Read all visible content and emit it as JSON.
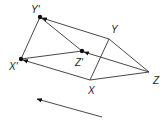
{
  "diagram": {
    "type": "geometric-translation",
    "colors": {
      "line": "#333333",
      "point": "#111111",
      "label": "#222222"
    },
    "points": {
      "X": {
        "label": "X",
        "x": 90,
        "y": 80
      },
      "Y": {
        "label": "Y",
        "x": 109,
        "y": 39
      },
      "Z": {
        "label": "Z",
        "x": 149,
        "y": 72
      },
      "X1": {
        "label": "X'",
        "x": 21,
        "y": 59
      },
      "Y1": {
        "label": "Y'",
        "x": 40,
        "y": 17
      },
      "Z1": {
        "label": "Z'",
        "x": 82,
        "y": 51
      }
    },
    "labels": {
      "X": "X",
      "Y": "Y",
      "Z": "Z",
      "X1": "X'",
      "Y1": "Y'",
      "Z1": "Z'"
    },
    "original_triangle": [
      "X",
      "Y",
      "Z"
    ],
    "image_triangle": [
      "X'",
      "Y'",
      "Z'"
    ],
    "translation_vectors": [
      "X→X'",
      "Y→Y'",
      "Z→Z'"
    ],
    "direction_arrow": {
      "from": [
        102,
        117
      ],
      "to": [
        36,
        99
      ]
    }
  }
}
